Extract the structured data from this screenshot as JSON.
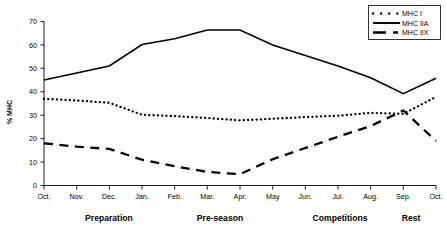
{
  "chart_data": {
    "type": "line",
    "title": "",
    "xlabel": "",
    "ylabel": "% MHC",
    "ylim": [
      0,
      70
    ],
    "ytick_step": 10,
    "grid": false,
    "legend_position": "top-right",
    "categories": [
      "Oct.",
      "Nov.",
      "Dec.",
      "Jan.",
      "Feb.",
      "Mar.",
      "Apr.",
      "May",
      "Jun.",
      "Jul.",
      "Aug.",
      "Sep.",
      "Oct."
    ],
    "yticks": [
      "0",
      "10",
      "20",
      "30",
      "40",
      "50",
      "60",
      "70"
    ],
    "series": [
      {
        "name": "MHC I",
        "style": "dotted",
        "color": "#000000",
        "values": [
          37.0,
          36.3,
          35.3,
          30.2,
          29.6,
          28.8,
          27.8,
          28.5,
          29.2,
          29.8,
          31.0,
          30.6,
          37.8
        ]
      },
      {
        "name": "MHC IIA",
        "style": "solid",
        "color": "#000000",
        "values": [
          45.0,
          48.0,
          51.0,
          60.2,
          62.6,
          66.4,
          66.4,
          60.0,
          55.5,
          51.0,
          46.0,
          39.2,
          45.8
        ]
      },
      {
        "name": "MHC IIX",
        "style": "dash-dot",
        "color": "#000000",
        "values": [
          18.0,
          16.6,
          15.6,
          11.0,
          8.2,
          5.8,
          4.8,
          11.2,
          16.0,
          20.8,
          25.4,
          32.0,
          19.0
        ]
      }
    ],
    "annotations": [
      {
        "label": "Preparation",
        "x_center": 2.0
      },
      {
        "label": "Pre-season",
        "x_center": 6.0
      },
      {
        "label": "Competitions",
        "x_center": 10.0
      },
      {
        "label": "Rest",
        "x_center": 12.0
      }
    ]
  },
  "legend": {
    "entries": [
      {
        "label": "MHC I",
        "style": "dotted"
      },
      {
        "label": "MHC IIA",
        "style": "solid"
      },
      {
        "label": "MHC IIX",
        "style": "dash-dot"
      }
    ]
  }
}
